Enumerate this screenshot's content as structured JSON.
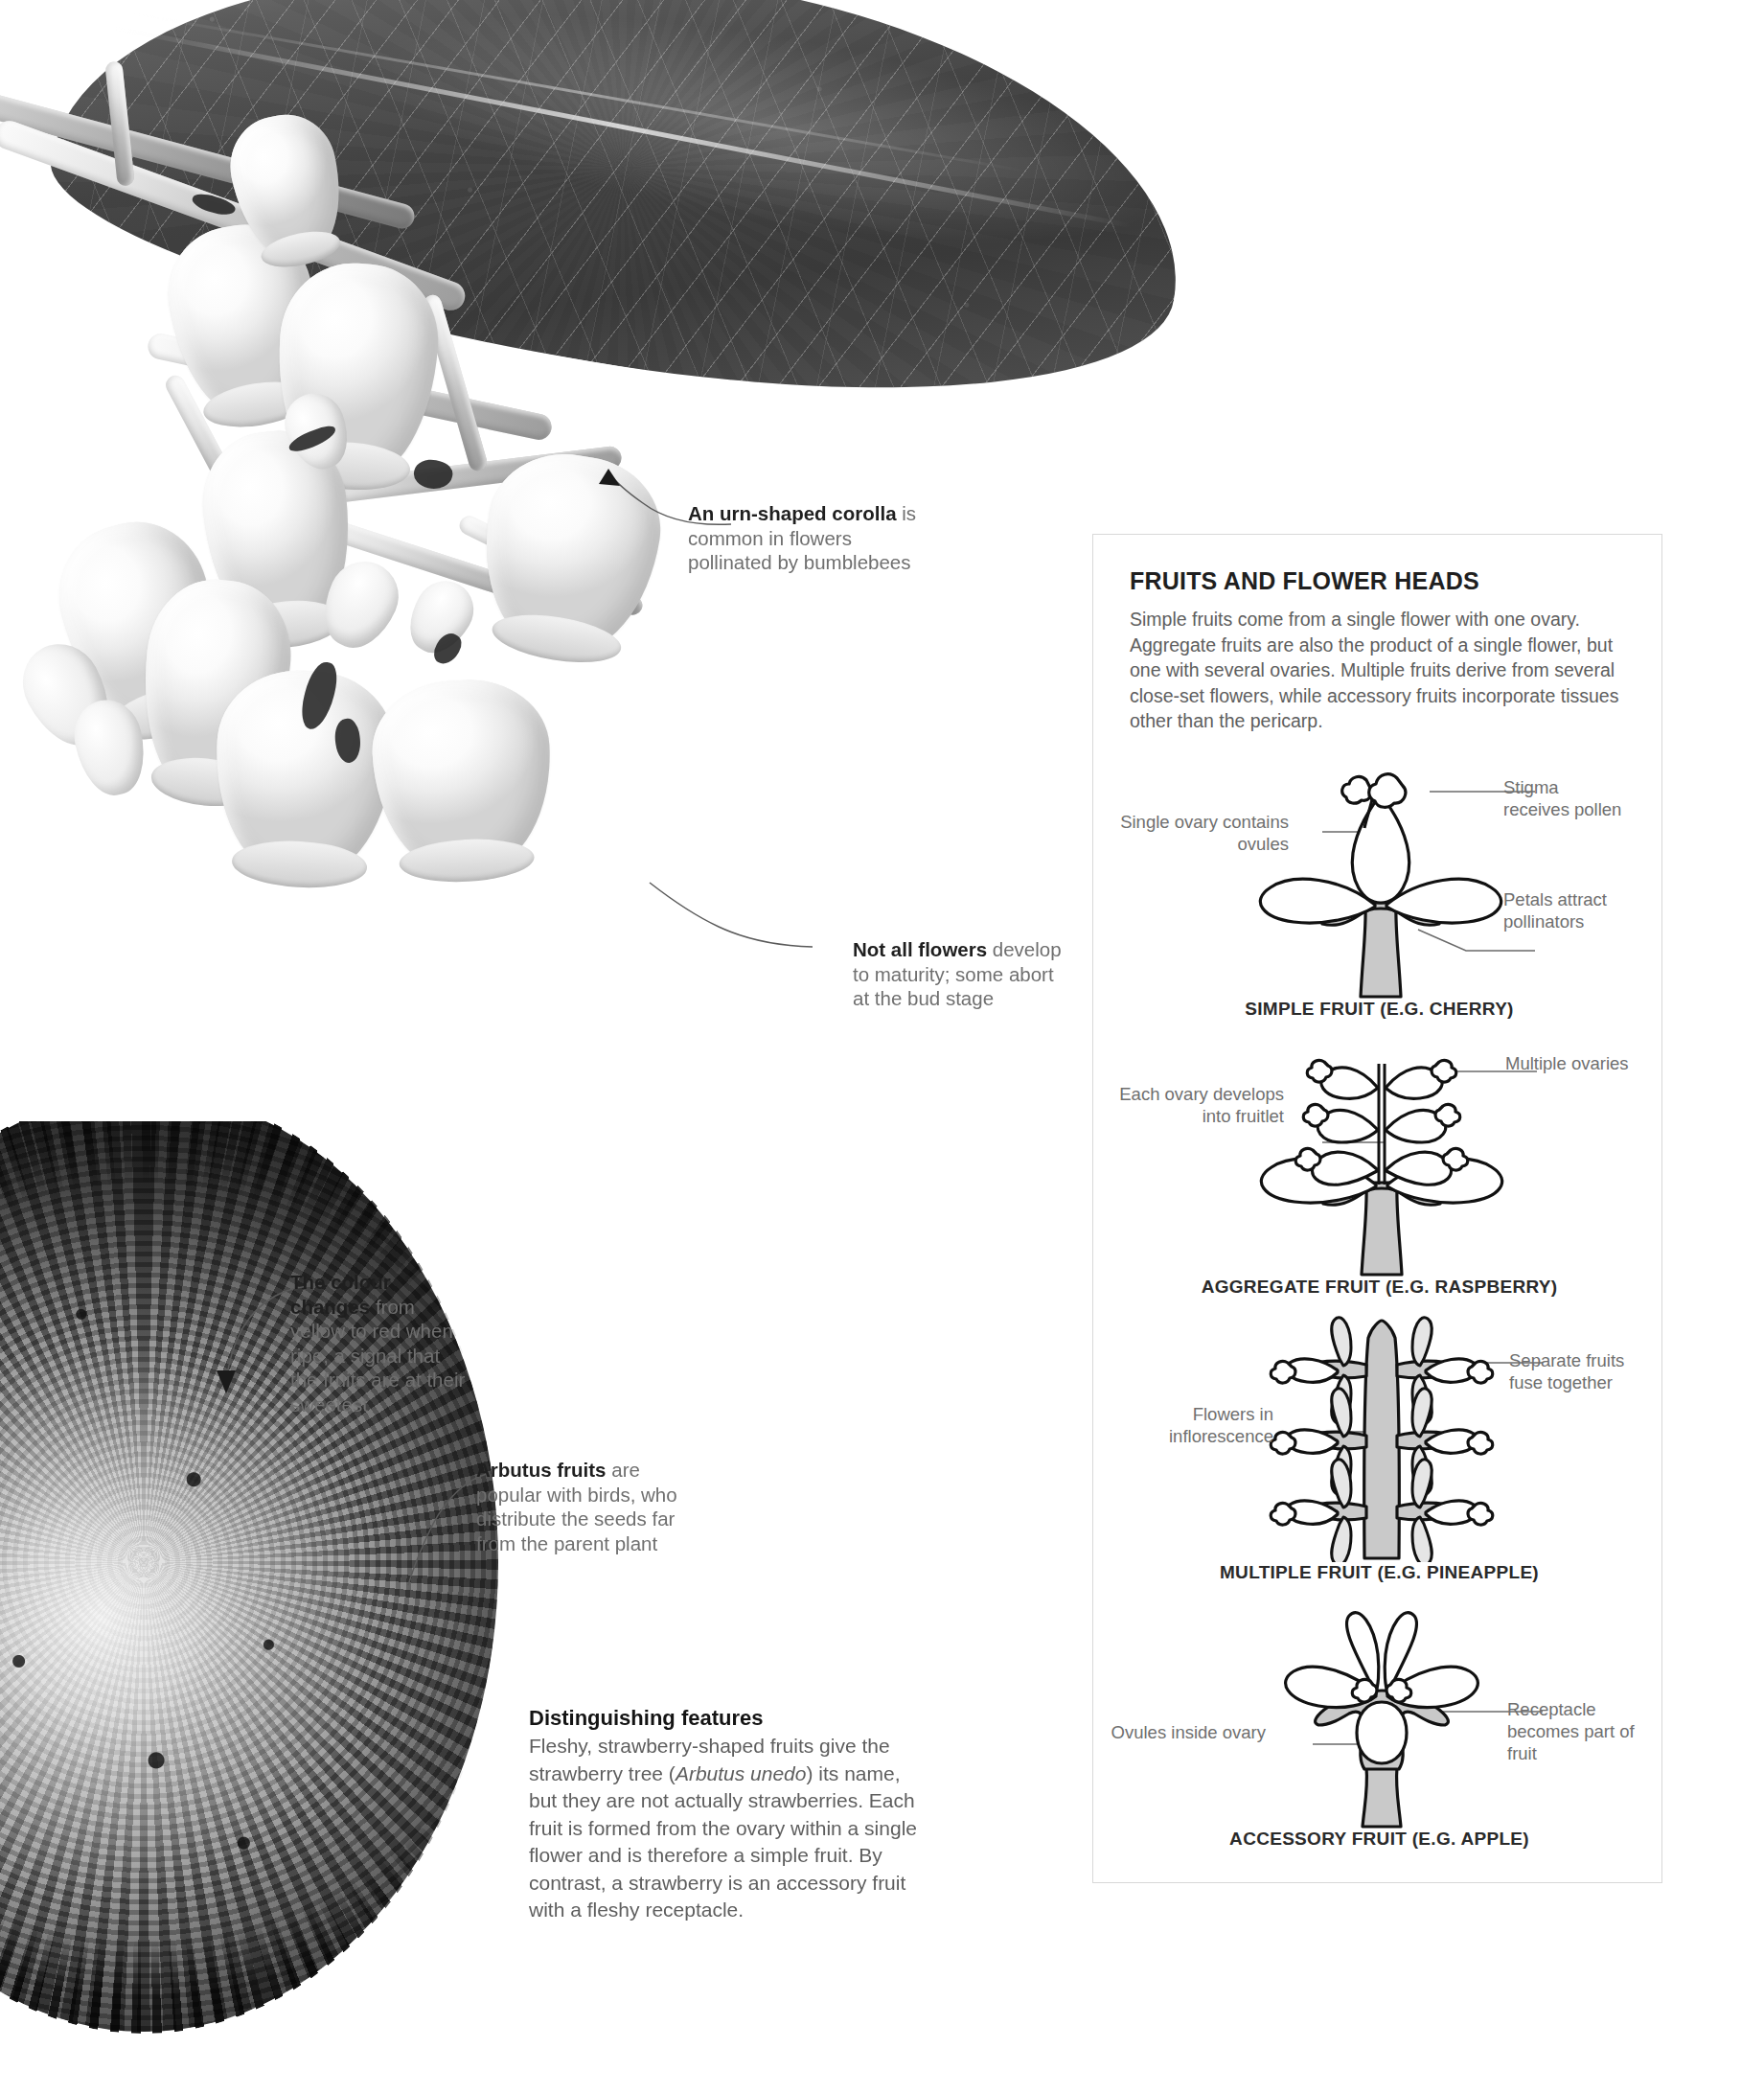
{
  "photos": {
    "leaf": "leathery-serrated-leaf-underside",
    "flowers": "arbutus-unedo-urn-shaped-flower-cluster",
    "fruit": "ripe-warty-arbutus-fruit-closeup"
  },
  "callouts": [
    {
      "name": "urn-corolla",
      "bold": "An urn-shaped corolla",
      "rest": "is common in flowers pollinated by bumblebees"
    },
    {
      "name": "flower-abortion",
      "bold": "Not all flowers",
      "rest": "develop to maturity; some abort at the bud stage"
    },
    {
      "name": "colour-change",
      "bold": "The colour changes",
      "rest": "from yellow to red when ripe, a signal that the fruits are at their sweetest"
    },
    {
      "name": "birds-disperse",
      "bold": "Arbutus fruits",
      "rest": "are popular with birds, who distribute the seeds far from the parent plant"
    }
  ],
  "panel": {
    "title": "FRUITS AND FLOWER HEADS",
    "intro": "Simple fruits come from a single flower with one ovary. Aggregate fruits are also the product of a single flower, but one with several ovaries. Multiple fruits derive from several close-set flowers, while accessory fruits incorporate tissues other than the pericarp.",
    "diagrams": [
      {
        "caption": "SIMPLE FRUIT (E.G. CHERRY)",
        "labels": {
          "left": "Single ovary contains ovules",
          "right_top": "Stigma receives pollen",
          "right_bottom": "Petals attract pollinators"
        }
      },
      {
        "caption": "AGGREGATE FRUIT (E.G. RASPBERRY)",
        "labels": {
          "left": "Each ovary develops into fruitlet",
          "right_top": "Multiple ovaries"
        }
      },
      {
        "caption": "MULTIPLE FRUIT (E.G. PINEAPPLE)",
        "labels": {
          "left": "Flowers in inflorescence",
          "right_top": "Separate fruits fuse together"
        }
      },
      {
        "caption": "ACCESSORY FRUIT (E.G. APPLE)",
        "labels": {
          "left": "Ovules inside ovary",
          "right_bottom": "Receptacle becomes part of fruit"
        }
      }
    ]
  },
  "features": {
    "heading": "Distinguishing features",
    "text_1": "Fleshy, strawberry-shaped fruits give the strawberry tree (",
    "species": "Arbutus unedo",
    "text_2": ") its name, but they are not actually strawberries. Each fruit is formed from the ovary within a single flower and is therefore a simple fruit. By contrast, a strawberry is an accessory fruit with a fleshy receptacle."
  },
  "colors": {
    "body_text": "#5e5e5e",
    "heading_text": "#141414",
    "panel_border": "#d8d8d8",
    "panel_bar": "#c4c4c4",
    "diagram_grey": "#c9c9c9"
  }
}
